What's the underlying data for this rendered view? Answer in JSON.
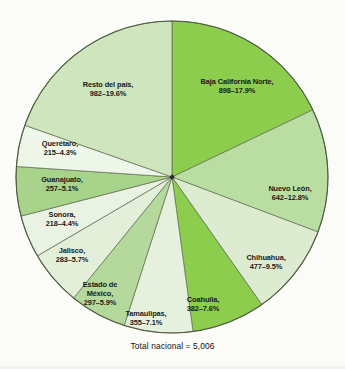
{
  "figure": {
    "total_caption": "Total nacional = 5,006",
    "center": {
      "x": 172,
      "y": 177
    },
    "radius": 156
  },
  "chart_data": {
    "type": "pie",
    "title": "",
    "subtitle": "",
    "xlabel": "",
    "ylabel": "",
    "legend_position": "none",
    "grid": false,
    "total_label": "Total nacional = 5,006",
    "total_value": 5006,
    "start_angle_deg": 0,
    "direction": "clockwise",
    "value_unit": "count",
    "categories": [
      "Baja California Norte",
      "Nuevo León",
      "Chihuahua",
      "Coahuila",
      "Tamaulipas",
      "Estado de México",
      "Jalisco",
      "Sonora",
      "Guanajuato",
      "Querétaro",
      "Resto del país"
    ],
    "values": [
      898,
      642,
      477,
      382,
      355,
      297,
      283,
      218,
      257,
      215,
      982
    ],
    "percents": [
      17.9,
      12.8,
      9.5,
      7.6,
      7.1,
      5.9,
      5.7,
      4.4,
      5.1,
      4.3,
      19.6
    ],
    "slices": [
      {
        "name": "Baja California Norte",
        "value": 898,
        "percent": 17.9,
        "color": "#8ccd4e",
        "label_lines": [
          "Baja California Norte,",
          "898–17.9%"
        ],
        "label_x": 237,
        "label_y": 86
      },
      {
        "name": "Nuevo León",
        "value": 642,
        "percent": 12.8,
        "color": "#badda1",
        "label_lines": [
          "Nuevo León,",
          "642–12.8%"
        ],
        "label_x": 290,
        "label_y": 193
      },
      {
        "name": "Chihuahua",
        "value": 477,
        "percent": 9.5,
        "color": "#ddecd1",
        "label_lines": [
          "Chihuahua,",
          "477–9.5%"
        ],
        "label_x": 266,
        "label_y": 262
      },
      {
        "name": "Coahuila",
        "value": 382,
        "percent": 7.6,
        "color": "#8ccd4e",
        "label_lines": [
          "Coahuila,",
          "382–7.6%"
        ],
        "label_x": 203,
        "label_y": 304
      },
      {
        "name": "Tamaulipas",
        "value": 355,
        "percent": 7.1,
        "color": "#e6f1dd",
        "label_lines": [
          "Tamaulipas,",
          "355–7.1%"
        ],
        "label_x": 146,
        "label_y": 318
      },
      {
        "name": "Estado de México",
        "value": 297,
        "percent": 5.9,
        "color": "#b5d99c",
        "label_lines": [
          "Estado de",
          "México,",
          "297–5.9%"
        ],
        "label_x": 100,
        "label_y": 294
      },
      {
        "name": "Jalisco",
        "value": 283,
        "percent": 5.7,
        "color": "#e3efd9",
        "label_lines": [
          "Jalisco,",
          "283–5.7%"
        ],
        "label_x": 72,
        "label_y": 255
      },
      {
        "name": "Sonora",
        "value": 218,
        "percent": 4.4,
        "color": "#eaf3e3",
        "label_lines": [
          "Sonora,",
          "218–4.4%"
        ],
        "label_x": 62,
        "label_y": 219
      },
      {
        "name": "Guanajuato",
        "value": 257,
        "percent": 5.1,
        "color": "#a8d38a",
        "label_lines": [
          "Guanajuato,",
          "257–5.1%"
        ],
        "label_x": 62,
        "label_y": 184
      },
      {
        "name": "Querétaro",
        "value": 215,
        "percent": 4.3,
        "color": "#eef5e9",
        "label_lines": [
          "Querétaro,",
          "215–4.3%"
        ],
        "label_x": 60,
        "label_y": 148
      },
      {
        "name": "Resto del país",
        "value": 982,
        "percent": 19.6,
        "color": "#cfe5bd",
        "label_lines": [
          "Resto del país,",
          "982–19.6%"
        ],
        "label_x": 108,
        "label_y": 89
      }
    ]
  }
}
